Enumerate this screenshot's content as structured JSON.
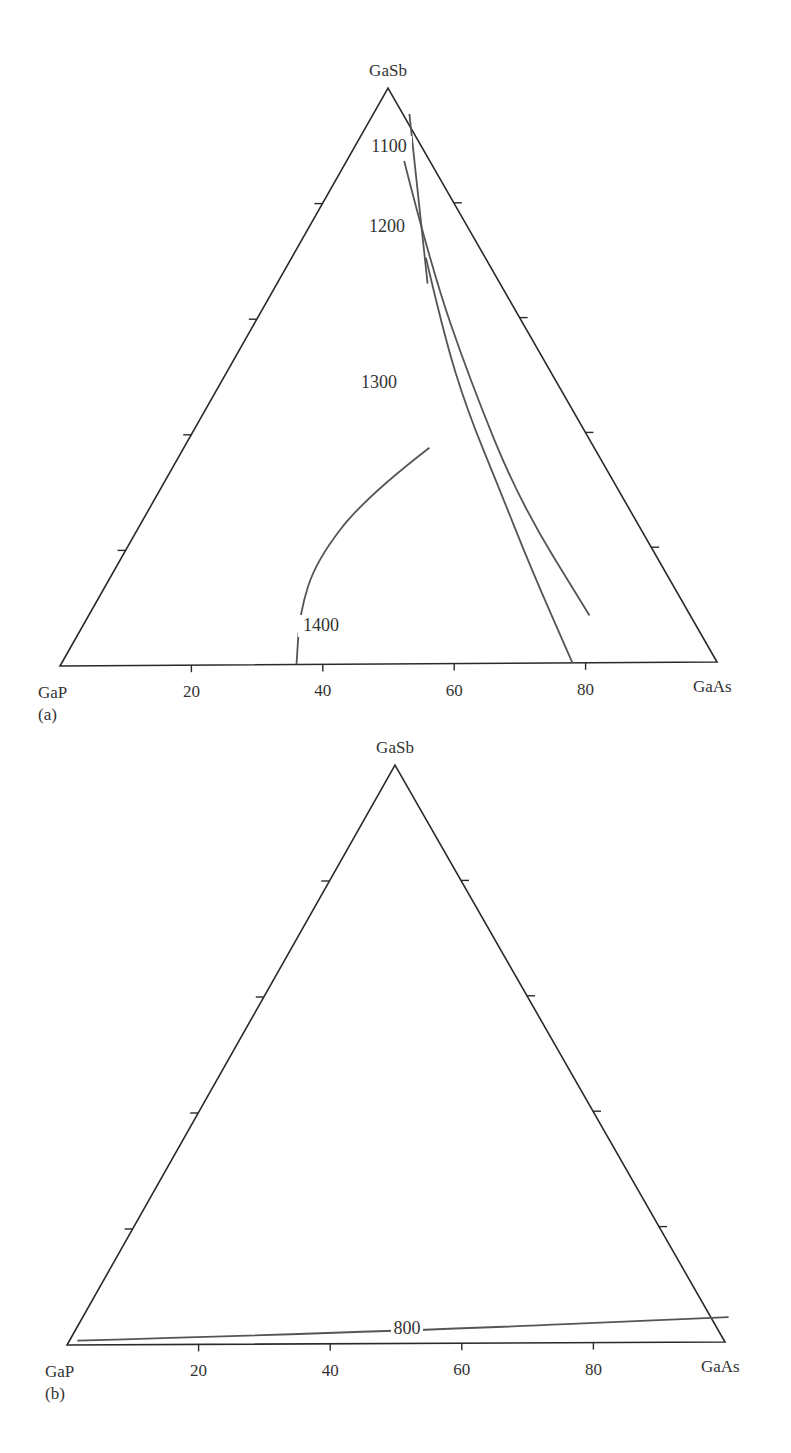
{
  "chart_data": [
    {
      "type": "ternary-contour",
      "panel_label": "(a)",
      "vertices": {
        "top": "GaSb",
        "left": "GaP",
        "right": "GaAs"
      },
      "base_axis_ticks": [
        "20",
        "40",
        "60",
        "80"
      ],
      "tick_values": [
        20,
        40,
        60,
        80
      ],
      "isotherms": [
        {
          "label": "1100",
          "value": 1100,
          "points": [
            [
              5.5,
              95.5
            ],
            [
              23,
              66
            ]
          ]
        },
        {
          "label": "1200",
          "value": 1200,
          "points": [
            [
              8.8,
              87.3
            ],
            [
              22,
              69
            ],
            [
              38,
              49
            ],
            [
              56,
              28
            ],
            [
              76.5,
              8.2
            ]
          ]
        },
        {
          "label": "1300",
          "value": 1300,
          "points": [
            [
              20.5,
              70.5
            ],
            [
              30,
              57
            ],
            [
              40,
              44
            ],
            [
              52,
              30
            ],
            [
              63,
              17
            ],
            [
              78,
              0
            ]
          ]
        },
        {
          "label": "1400",
          "value": 1400,
          "points": [
            [
              37.5,
              37.5
            ],
            [
              32,
              29
            ],
            [
              30,
              18
            ],
            [
              32,
              9
            ],
            [
              36,
              0
            ]
          ]
        }
      ],
      "label_positions_frac": {
        "1100": [
          0.5,
          0.1
        ],
        "1200": [
          0.5,
          0.24
        ],
        "1300": [
          0.5,
          0.52
        ],
        "1400": [
          0.5,
          0.88
        ]
      }
    },
    {
      "type": "ternary-contour",
      "panel_label": "(b)",
      "vertices": {
        "top": "GaSb",
        "left": "GaP",
        "right": "GaAs"
      },
      "base_axis_ticks": [
        "20",
        "40",
        "60",
        "80"
      ],
      "tick_values": [
        20,
        40,
        60,
        80
      ],
      "isotherms": [
        {
          "label": "800",
          "value": 800,
          "points": [
            [
              1.2,
              0.75
            ],
            [
              50,
              2.1
            ],
            [
              98.4,
              4.3
            ]
          ]
        }
      ]
    }
  ]
}
